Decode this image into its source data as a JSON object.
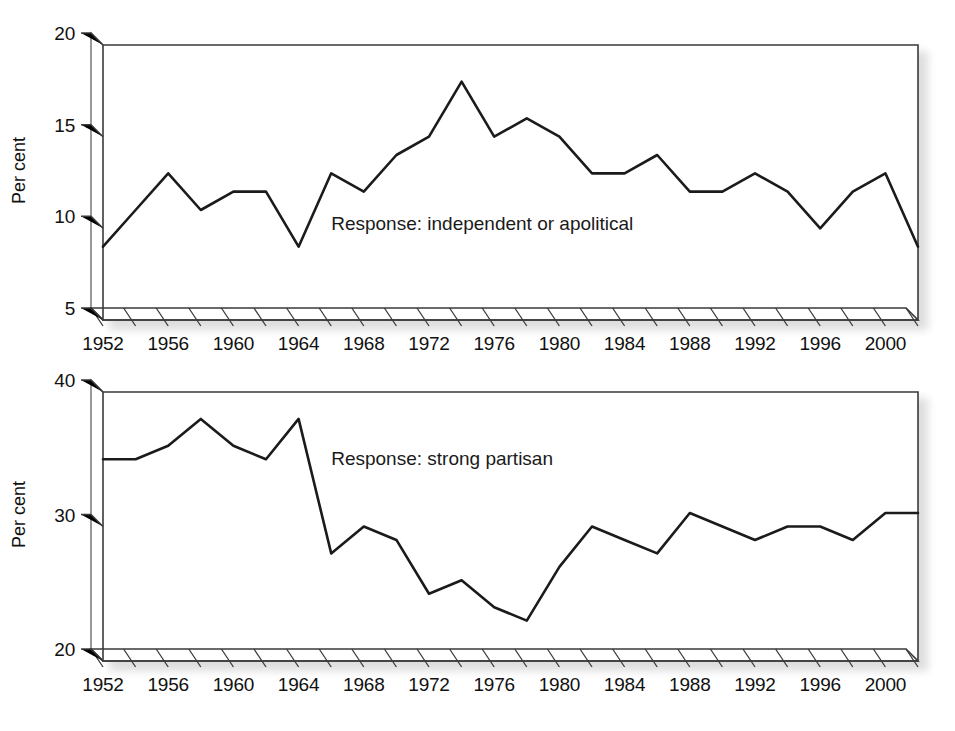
{
  "figure": {
    "background_color": "#ffffff",
    "line_color": "#1b1b1b",
    "axis_color": "#3a3a3a",
    "caption_partial": "",
    "ylabel": "Per cent"
  },
  "chart_data": [
    {
      "type": "line",
      "panel": "top",
      "title": "",
      "annotation": "Response: independent or apolitical",
      "annotation_x": 1966,
      "annotation_y": 9.9,
      "xlabel": "",
      "ylabel": "Per cent",
      "xlim": [
        1952,
        2002
      ],
      "ylim": [
        5,
        20
      ],
      "yticks": [
        5,
        10,
        15,
        20
      ],
      "ytick_labels": [
        "5",
        "10",
        "15",
        "20"
      ],
      "xticks": [
        1952,
        1954,
        1956,
        1958,
        1960,
        1962,
        1964,
        1966,
        1968,
        1970,
        1972,
        1974,
        1976,
        1978,
        1980,
        1982,
        1984,
        1986,
        1988,
        1990,
        1992,
        1994,
        1996,
        1998,
        2000,
        2002
      ],
      "xtick_labels": [
        "1952",
        "",
        "1956",
        "",
        "1960",
        "",
        "1964",
        "",
        "1968",
        "",
        "1972",
        "",
        "1976",
        "",
        "1980",
        "",
        "1984",
        "",
        "1988",
        "",
        "1992",
        "",
        "1996",
        "",
        "2000",
        ""
      ],
      "grid": false,
      "legend": "none",
      "x": [
        1952,
        1954,
        1956,
        1958,
        1960,
        1962,
        1964,
        1966,
        1968,
        1970,
        1972,
        1974,
        1976,
        1978,
        1980,
        1982,
        1984,
        1986,
        1988,
        1990,
        1992,
        1994,
        1996,
        1998,
        2000,
        2002
      ],
      "values": [
        9,
        11,
        13,
        11,
        12,
        12,
        9,
        13,
        12,
        14,
        15,
        18,
        15,
        16,
        15,
        13,
        13,
        14,
        12,
        12,
        13,
        12,
        10,
        12,
        13,
        9
      ]
    },
    {
      "type": "line",
      "panel": "bottom",
      "title": "",
      "annotation": "Response: strong partisan",
      "annotation_x": 1966,
      "annotation_y": 34.6,
      "xlabel": "",
      "ylabel": "Per cent",
      "xlim": [
        1952,
        2002
      ],
      "ylim": [
        20,
        40
      ],
      "yticks": [
        20,
        30,
        40
      ],
      "ytick_labels": [
        "20",
        "30",
        "40"
      ],
      "xticks": [
        1952,
        1954,
        1956,
        1958,
        1960,
        1962,
        1964,
        1966,
        1968,
        1970,
        1972,
        1974,
        1976,
        1978,
        1980,
        1982,
        1984,
        1986,
        1988,
        1990,
        1992,
        1994,
        1996,
        1998,
        2000,
        2002
      ],
      "xtick_labels": [
        "1952",
        "",
        "1956",
        "",
        "1960",
        "",
        "1964",
        "",
        "1968",
        "",
        "1972",
        "",
        "1976",
        "",
        "1980",
        "",
        "1984",
        "",
        "1988",
        "",
        "1992",
        "",
        "1996",
        "",
        "2000",
        ""
      ],
      "grid": false,
      "legend": "none",
      "x": [
        1952,
        1954,
        1956,
        1958,
        1960,
        1962,
        1964,
        1966,
        1968,
        1970,
        1972,
        1974,
        1976,
        1978,
        1980,
        1982,
        1984,
        1986,
        1988,
        1990,
        1992,
        1994,
        1996,
        1998,
        2000,
        2002
      ],
      "values": [
        35,
        35,
        36,
        38,
        36,
        35,
        38,
        28,
        30,
        29,
        25,
        26,
        24,
        23,
        27,
        30,
        29,
        28,
        31,
        30,
        29,
        30,
        30,
        29,
        31,
        31
      ]
    }
  ]
}
